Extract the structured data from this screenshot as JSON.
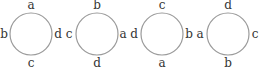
{
  "figure": {
    "circles": [
      {
        "top": "a",
        "left": "b",
        "right": "d",
        "bottom": "c"
      },
      {
        "top": "b",
        "left": "c",
        "right": "a",
        "bottom": "d"
      },
      {
        "top": "c",
        "left": "d",
        "right": "b",
        "bottom": "a"
      },
      {
        "top": "d",
        "left": "a",
        "right": "c",
        "bottom": "b"
      }
    ],
    "colors": {
      "stroke": "#9a9a9a",
      "text": "#333333"
    }
  }
}
